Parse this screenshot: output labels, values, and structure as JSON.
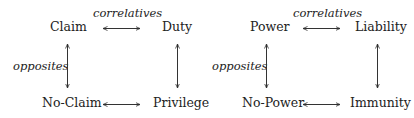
{
  "diagrams": [
    {
      "name": "first-order",
      "top_left": "Claim",
      "top_right": "Duty",
      "bottom_left": "No-Claim",
      "bottom_right": "Privilege",
      "horizontal_label": "correlatives",
      "vertical_label": "opposites"
    },
    {
      "name": "second-order",
      "top_left": "Power",
      "top_right": "Liability",
      "bottom_left": "No-Power",
      "bottom_right": "Immunity",
      "horizontal_label": "correlatives",
      "vertical_label": "opposites"
    }
  ],
  "colors": {
    "text": "#222222",
    "arrow": "#333333",
    "background": "#ffffff"
  }
}
